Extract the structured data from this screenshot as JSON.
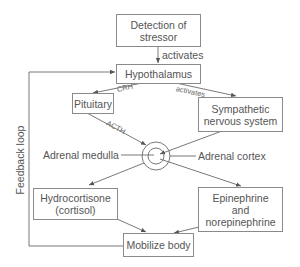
{
  "diagram": {
    "nodes": {
      "detection": "Detection of stressor",
      "hypothalamus": "Hypothalamus",
      "pituitary": "Pituitary",
      "sympathetic": "Sympathetic nervous system",
      "hydrocortisone": "Hydrocortisone (cortisol)",
      "epinephrine": "Epinephrine and norepinephrine",
      "mobilize": "Mobilize body"
    },
    "labels": {
      "adrenal_medulla": "Adrenal medulla",
      "adrenal_cortex": "Adrenal cortex",
      "feedback_loop": "Feedback loop"
    },
    "edge_labels": {
      "detection_to_hypothalamus": "activates",
      "hypothalamus_to_pituitary": "CRH",
      "hypothalamus_to_sympathetic": "activates",
      "pituitary_to_adrenal": "ACTH"
    },
    "colors": {
      "line": "#6a6a6a",
      "box_border": "#8a8a8a",
      "text": "#555555"
    }
  }
}
